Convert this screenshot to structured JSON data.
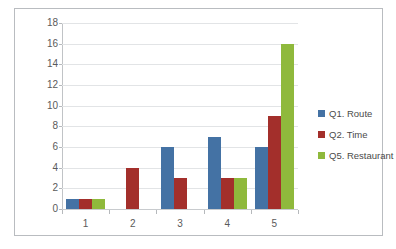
{
  "chart_data": {
    "type": "bar",
    "title": "",
    "subtitle": "",
    "xlabel": "",
    "ylabel": "",
    "categories": [
      "1",
      "2",
      "3",
      "4",
      "5"
    ],
    "series": [
      {
        "name": "Q1. Route",
        "color": "#4472a4",
        "values": [
          1,
          0,
          6,
          7,
          6
        ]
      },
      {
        "name": "Q2. Time",
        "color": "#a32f2b",
        "values": [
          1,
          4,
          3,
          3,
          9
        ]
      },
      {
        "name": "Q5. Restaurant",
        "color": "#8fb93c",
        "values": [
          1,
          0,
          0,
          3,
          16
        ]
      }
    ],
    "ylim": [
      0,
      18
    ],
    "ytick_values": [
      0,
      2,
      4,
      6,
      8,
      10,
      12,
      14,
      16,
      18
    ],
    "ytick_labels": [
      "0",
      "2",
      "4",
      "6",
      "8",
      "10",
      "12",
      "14",
      "16",
      "18"
    ],
    "grid": true,
    "grid_axis": "y",
    "legend_position": "right",
    "bar_mode": "grouped"
  },
  "frame": {
    "border_color": "#b9bcc0",
    "background": "#ffffff"
  }
}
